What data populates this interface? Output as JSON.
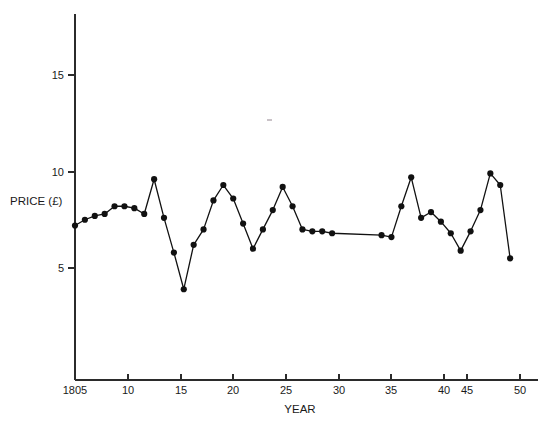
{
  "chart_data": {
    "type": "line",
    "title": "",
    "subtitle": "",
    "xlabel": "YEAR",
    "ylabel": "PRICE (£)",
    "xlim": [
      1804,
      1851
    ],
    "ylim": [
      0,
      17.8
    ],
    "grid": false,
    "legend": "none",
    "x_tick_labels": [
      "1805",
      "10",
      "15",
      "20",
      "25",
      "30",
      "35",
      "40",
      "45",
      "50"
    ],
    "x_tick_values": [
      1805,
      1810,
      1815,
      1820,
      1825,
      1830,
      1835,
      1840,
      1845,
      1850
    ],
    "y_tick_labels": [
      "5",
      "10",
      "15"
    ],
    "y_tick_values": [
      5,
      10,
      15
    ],
    "marker": "filled-circle",
    "series": [
      {
        "name": "Price",
        "x": [
          1805,
          1806,
          1807,
          1808,
          1809,
          1810,
          1811,
          1812,
          1813,
          1814,
          1815,
          1816,
          1817,
          1818,
          1819,
          1820,
          1821,
          1822,
          1823,
          1824,
          1825,
          1826,
          1827,
          1828,
          1829,
          1830,
          1831,
          1836,
          1837,
          1838,
          1839,
          1840,
          1841,
          1842,
          1843,
          1844,
          1845,
          1846,
          1847,
          1848,
          1849
        ],
        "values": [
          7.2,
          7.5,
          7.7,
          7.8,
          8.2,
          8.2,
          8.1,
          7.8,
          9.6,
          7.6,
          5.8,
          3.9,
          6.2,
          7.0,
          8.5,
          9.3,
          8.6,
          7.3,
          6.0,
          7.0,
          8.0,
          9.2,
          8.2,
          7.0,
          6.9,
          6.9,
          6.8,
          6.7,
          6.6,
          8.2,
          9.7,
          7.6,
          7.9,
          7.4,
          6.8,
          5.9,
          6.9,
          8.0,
          9.9,
          9.3,
          5.5
        ]
      }
    ]
  },
  "axes": {
    "y_label": "PRICE (£)",
    "x_label": "YEAR"
  }
}
